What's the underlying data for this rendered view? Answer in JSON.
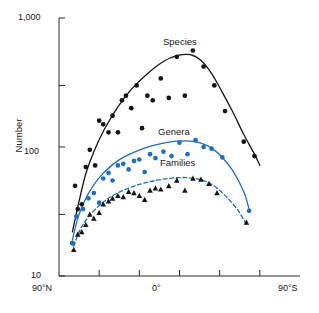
{
  "chart_data": {
    "type": "scatter",
    "title": "",
    "xlabel": "",
    "ylabel": "Number",
    "yscale": "log",
    "ylim": [
      10,
      1000
    ],
    "xlim": [
      90,
      -90
    ],
    "grid": false,
    "legend_position": "inline-annotations",
    "y_ticks": [
      {
        "value": 1000,
        "label": "1,000"
      },
      {
        "value": 300,
        "label": ""
      },
      {
        "value": 100,
        "label": "100"
      },
      {
        "value": 30,
        "label": ""
      },
      {
        "value": 10,
        "label": "10"
      }
    ],
    "x_ticks": [
      {
        "value": 90,
        "label": "90°N"
      },
      {
        "value": 60,
        "label": ""
      },
      {
        "value": 30,
        "label": ""
      },
      {
        "value": 0,
        "label": "0°"
      },
      {
        "value": -30,
        "label": ""
      },
      {
        "value": -60,
        "label": ""
      },
      {
        "value": -90,
        "label": "90°S"
      }
    ],
    "series": [
      {
        "name": "Species",
        "marker": "circle",
        "marker_color": "#151515",
        "curve_color": "#151515",
        "curve_style": "solid",
        "points": [
          {
            "x": 80,
            "y": 18
          },
          {
            "x": 78,
            "y": 50
          },
          {
            "x": 76,
            "y": 33
          },
          {
            "x": 73,
            "y": 36
          },
          {
            "x": 70,
            "y": 70
          },
          {
            "x": 67,
            "y": 95
          },
          {
            "x": 63,
            "y": 72
          },
          {
            "x": 60,
            "y": 160
          },
          {
            "x": 57,
            "y": 150
          },
          {
            "x": 53,
            "y": 130
          },
          {
            "x": 50,
            "y": 175
          },
          {
            "x": 46,
            "y": 130
          },
          {
            "x": 43,
            "y": 230
          },
          {
            "x": 40,
            "y": 250
          },
          {
            "x": 36,
            "y": 200
          },
          {
            "x": 32,
            "y": 300
          },
          {
            "x": 28,
            "y": 140
          },
          {
            "x": 24,
            "y": 250
          },
          {
            "x": 20,
            "y": 230
          },
          {
            "x": 14,
            "y": 340
          },
          {
            "x": 8,
            "y": 240
          },
          {
            "x": 2,
            "y": 500
          },
          {
            "x": -4,
            "y": 250
          },
          {
            "x": -10,
            "y": 560
          },
          {
            "x": -18,
            "y": 420
          },
          {
            "x": -26,
            "y": 300
          },
          {
            "x": -34,
            "y": 190
          },
          {
            "x": -48,
            "y": 110
          },
          {
            "x": -56,
            "y": 85
          }
        ],
        "curve": [
          {
            "x": 80,
            "y": 22
          },
          {
            "x": 75,
            "y": 38
          },
          {
            "x": 70,
            "y": 62
          },
          {
            "x": 64,
            "y": 92
          },
          {
            "x": 56,
            "y": 138
          },
          {
            "x": 46,
            "y": 205
          },
          {
            "x": 36,
            "y": 280
          },
          {
            "x": 24,
            "y": 370
          },
          {
            "x": 12,
            "y": 460
          },
          {
            "x": 2,
            "y": 510
          },
          {
            "x": -8,
            "y": 520
          },
          {
            "x": -16,
            "y": 470
          },
          {
            "x": -24,
            "y": 370
          },
          {
            "x": -32,
            "y": 265
          },
          {
            "x": -40,
            "y": 185
          },
          {
            "x": -48,
            "y": 125
          },
          {
            "x": -56,
            "y": 88
          },
          {
            "x": -60,
            "y": 72
          }
        ]
      },
      {
        "name": "Genera",
        "marker": "circle",
        "marker_color": "#1f6fc0",
        "curve_color": "#1f6fc0",
        "curve_style": "solid",
        "points": [
          {
            "x": 80,
            "y": 18
          },
          {
            "x": 77,
            "y": 29
          },
          {
            "x": 72,
            "y": 33
          },
          {
            "x": 68,
            "y": 40
          },
          {
            "x": 64,
            "y": 44
          },
          {
            "x": 60,
            "y": 37
          },
          {
            "x": 57,
            "y": 57
          },
          {
            "x": 53,
            "y": 63
          },
          {
            "x": 50,
            "y": 55
          },
          {
            "x": 46,
            "y": 72
          },
          {
            "x": 42,
            "y": 74
          },
          {
            "x": 38,
            "y": 67
          },
          {
            "x": 34,
            "y": 78
          },
          {
            "x": 30,
            "y": 80
          },
          {
            "x": 26,
            "y": 64
          },
          {
            "x": 22,
            "y": 88
          },
          {
            "x": 18,
            "y": 82
          },
          {
            "x": 12,
            "y": 92
          },
          {
            "x": 6,
            "y": 85
          },
          {
            "x": 0,
            "y": 108
          },
          {
            "x": -6,
            "y": 88
          },
          {
            "x": -12,
            "y": 113
          },
          {
            "x": -18,
            "y": 100
          },
          {
            "x": -24,
            "y": 97
          },
          {
            "x": -32,
            "y": 83
          },
          {
            "x": -52,
            "y": 32
          }
        ],
        "curve": [
          {
            "x": 80,
            "y": 19
          },
          {
            "x": 76,
            "y": 28
          },
          {
            "x": 71,
            "y": 38
          },
          {
            "x": 65,
            "y": 49
          },
          {
            "x": 58,
            "y": 61
          },
          {
            "x": 50,
            "y": 73
          },
          {
            "x": 42,
            "y": 83
          },
          {
            "x": 32,
            "y": 93
          },
          {
            "x": 22,
            "y": 101
          },
          {
            "x": 12,
            "y": 107
          },
          {
            "x": 2,
            "y": 111
          },
          {
            "x": -8,
            "y": 111
          },
          {
            "x": -16,
            "y": 107
          },
          {
            "x": -24,
            "y": 98
          },
          {
            "x": -32,
            "y": 83
          },
          {
            "x": -40,
            "y": 65
          },
          {
            "x": -48,
            "y": 45
          },
          {
            "x": -52,
            "y": 33
          }
        ]
      },
      {
        "name": "Families",
        "marker": "triangle",
        "marker_color": "#151515",
        "curve_color": "#1f6fc0",
        "curve_style": "dashed",
        "points": [
          {
            "x": 79,
            "y": 16
          },
          {
            "x": 76,
            "y": 21
          },
          {
            "x": 73,
            "y": 22
          },
          {
            "x": 70,
            "y": 25
          },
          {
            "x": 67,
            "y": 30
          },
          {
            "x": 64,
            "y": 28
          },
          {
            "x": 60,
            "y": 31
          },
          {
            "x": 57,
            "y": 36
          },
          {
            "x": 53,
            "y": 38
          },
          {
            "x": 50,
            "y": 40
          },
          {
            "x": 46,
            "y": 42
          },
          {
            "x": 42,
            "y": 41
          },
          {
            "x": 38,
            "y": 45
          },
          {
            "x": 34,
            "y": 44
          },
          {
            "x": 30,
            "y": 42
          },
          {
            "x": 26,
            "y": 39
          },
          {
            "x": 22,
            "y": 46
          },
          {
            "x": 18,
            "y": 48
          },
          {
            "x": 14,
            "y": 47
          },
          {
            "x": 8,
            "y": 50
          },
          {
            "x": 2,
            "y": 55
          },
          {
            "x": -4,
            "y": 46
          },
          {
            "x": -10,
            "y": 57
          },
          {
            "x": -16,
            "y": 56
          },
          {
            "x": -22,
            "y": 52
          },
          {
            "x": -28,
            "y": 44
          },
          {
            "x": -50,
            "y": 26
          }
        ],
        "curve": [
          {
            "x": 79,
            "y": 17
          },
          {
            "x": 75,
            "y": 22
          },
          {
            "x": 70,
            "y": 27
          },
          {
            "x": 64,
            "y": 32
          },
          {
            "x": 56,
            "y": 38
          },
          {
            "x": 48,
            "y": 43
          },
          {
            "x": 38,
            "y": 48
          },
          {
            "x": 28,
            "y": 52
          },
          {
            "x": 18,
            "y": 55
          },
          {
            "x": 8,
            "y": 57
          },
          {
            "x": -2,
            "y": 58
          },
          {
            "x": -12,
            "y": 57
          },
          {
            "x": -20,
            "y": 54
          },
          {
            "x": -28,
            "y": 48
          },
          {
            "x": -36,
            "y": 40
          },
          {
            "x": -44,
            "y": 32
          },
          {
            "x": -50,
            "y": 25
          }
        ]
      }
    ]
  },
  "axis": {
    "y_label_top": "1,000",
    "y_label_mid": "100",
    "y_label_bottom": "10",
    "y_title": "Number",
    "x_label_left": "90°N",
    "x_label_center": "0°",
    "x_label_right": "90°S"
  },
  "annotations": {
    "species": "Species",
    "genera": "Genera",
    "families": "Families"
  },
  "colors": {
    "blue": "#1f6fc0",
    "black": "#151515",
    "background": "#ffffff"
  }
}
